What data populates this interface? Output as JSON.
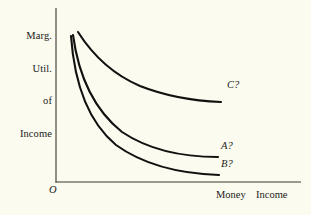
{
  "figure": {
    "background_color": "#fbfbef",
    "ink_color": "#1a1a18"
  },
  "axes": {
    "y_label_lines": [
      "Marg.",
      "Util.",
      "of",
      "Income"
    ],
    "y_label_text": "Marg. Util. of Income",
    "x_label": "Money  Income",
    "origin_label": "O"
  },
  "curve_labels": {
    "c": "C?",
    "a": "A?",
    "b": "B?"
  },
  "chart_data": {
    "type": "line",
    "title": "",
    "xlabel": "Money Income",
    "ylabel": "Marg. Util. of Income",
    "grid": false,
    "legend": "inline-right-of-curve-ends",
    "axis_ticks": "none",
    "annotations": [
      "O"
    ],
    "note": "Three downward-sloping convex marginal-utility-of-income curves; axes unscaled/qualitative.",
    "series": [
      {
        "name": "C?",
        "label": "C?",
        "label_position": {
          "x": 227,
          "y": 86
        },
        "path": "M 78 32 C 92 54, 112 74, 140 86 C 168 97, 196 101, 221 102",
        "points": [
          {
            "x": 78,
            "y": 32
          },
          {
            "x": 95,
            "y": 59
          },
          {
            "x": 115,
            "y": 75
          },
          {
            "x": 140,
            "y": 87
          },
          {
            "x": 170,
            "y": 95
          },
          {
            "x": 200,
            "y": 100
          },
          {
            "x": 221,
            "y": 102
          }
        ]
      },
      {
        "name": "A?",
        "label": "A?",
        "label_position": {
          "x": 221,
          "y": 147
        },
        "path": "M 73 35 C 78 72, 92 108, 122 132 C 152 152, 190 157, 218 157",
        "points": [
          {
            "x": 73,
            "y": 35
          },
          {
            "x": 80,
            "y": 80
          },
          {
            "x": 95,
            "y": 110
          },
          {
            "x": 122,
            "y": 133
          },
          {
            "x": 155,
            "y": 148
          },
          {
            "x": 190,
            "y": 155
          },
          {
            "x": 218,
            "y": 157
          }
        ]
      },
      {
        "name": "B?",
        "label": "B?",
        "label_position": {
          "x": 221,
          "y": 165
        },
        "path": "M 71 36 C 74 78, 86 120, 116 145 C 148 168, 190 174, 219 175",
        "points": [
          {
            "x": 71,
            "y": 36
          },
          {
            "x": 76,
            "y": 85
          },
          {
            "x": 90,
            "y": 122
          },
          {
            "x": 116,
            "y": 146
          },
          {
            "x": 152,
            "y": 165
          },
          {
            "x": 190,
            "y": 173
          },
          {
            "x": 219,
            "y": 175
          }
        ]
      }
    ],
    "axis_geometry": {
      "y_axis": {
        "x": 56,
        "y_top": 8,
        "y_bottom": 182
      },
      "x_axis": {
        "y": 182,
        "x_left": 56,
        "x_right": 301
      }
    }
  }
}
